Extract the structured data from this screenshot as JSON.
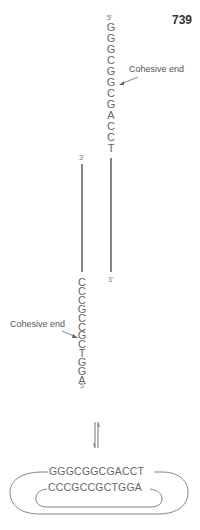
{
  "page_number": "739",
  "top_strand": {
    "start_label": "5'",
    "bases": [
      "G",
      "G",
      "G",
      "C",
      "G",
      "G",
      "C",
      "G",
      "A",
      "C",
      "C",
      "T"
    ],
    "end_label": "3'"
  },
  "bottom_strand": {
    "start_label": "3'",
    "bases": [
      "C",
      "C",
      "C",
      "G",
      "C",
      "C",
      "G",
      "C",
      "T",
      "G",
      "G",
      "A"
    ],
    "end_label": "5'"
  },
  "annotations": {
    "upper_cohesive_end": "Cohesive end",
    "lower_cohesive_end": "Cohesive end"
  },
  "circular_form": {
    "outer_sequence": "GGGCGGCGACCT",
    "inner_sequence": "CCCGCCGCTGGA"
  },
  "equilibrium_symbol": "⇌"
}
